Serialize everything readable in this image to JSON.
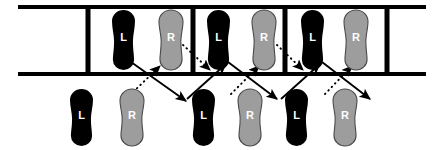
{
  "diagram": {
    "colors": {
      "left_foot": "#000000",
      "right_foot": "#9d9d9d",
      "right_foot_outline": "#4a4a4a",
      "ladder": "#000000",
      "label_text": "#ffffff",
      "background": "#ffffff",
      "arrow_solid": "#000000",
      "arrow_dotted": "#000000"
    },
    "labels": {
      "left": "L",
      "right": "R"
    },
    "ladder": {
      "rail_top_y": 7,
      "rail_bottom_y": 74,
      "rail_x_start": 18,
      "rail_x_end": 426,
      "rail_thickness": 4,
      "rung_thickness": 5,
      "rung_x_positions": [
        88,
        193,
        285,
        387
      ]
    },
    "footprints": [
      {
        "id": "top-l-1",
        "foot": "L",
        "label": "L",
        "row": "top",
        "x": 112,
        "y": 10,
        "w": 23,
        "h": 60
      },
      {
        "id": "top-r-1",
        "foot": "R",
        "label": "R",
        "row": "top",
        "x": 159,
        "y": 10,
        "w": 24,
        "h": 60
      },
      {
        "id": "top-l-2",
        "foot": "L",
        "label": "L",
        "row": "top",
        "x": 207,
        "y": 10,
        "w": 23,
        "h": 60
      },
      {
        "id": "top-r-2",
        "foot": "R",
        "label": "R",
        "row": "top",
        "x": 252,
        "y": 10,
        "w": 24,
        "h": 60
      },
      {
        "id": "top-l-3",
        "foot": "L",
        "label": "L",
        "row": "top",
        "x": 301,
        "y": 10,
        "w": 23,
        "h": 60
      },
      {
        "id": "top-r-3",
        "foot": "R",
        "label": "R",
        "row": "top",
        "x": 344,
        "y": 10,
        "w": 24,
        "h": 60
      },
      {
        "id": "bottom-l-1",
        "foot": "L",
        "label": "L",
        "row": "bottom",
        "x": 70,
        "y": 89,
        "w": 23,
        "h": 57
      },
      {
        "id": "bottom-r-1",
        "foot": "R",
        "label": "R",
        "row": "bottom",
        "x": 120,
        "y": 89,
        "w": 24,
        "h": 57
      },
      {
        "id": "bottom-l-2",
        "foot": "L",
        "label": "L",
        "row": "bottom",
        "x": 192,
        "y": 89,
        "w": 23,
        "h": 57
      },
      {
        "id": "bottom-r-2",
        "foot": "R",
        "label": "R",
        "row": "bottom",
        "x": 238,
        "y": 89,
        "w": 24,
        "h": 57
      },
      {
        "id": "bottom-l-3",
        "foot": "L",
        "label": "L",
        "row": "bottom",
        "x": 285,
        "y": 89,
        "w": 23,
        "h": 57
      },
      {
        "id": "bottom-r-3",
        "foot": "R",
        "label": "R",
        "row": "bottom",
        "x": 333,
        "y": 89,
        "w": 24,
        "h": 57
      }
    ],
    "arrows": [
      {
        "id": "solid-1",
        "style": "solid",
        "x1": 131,
        "y1": 62,
        "x2": 186,
        "y2": 101
      },
      {
        "id": "dotted-1",
        "style": "dotted",
        "x1": 130,
        "y1": 95,
        "x2": 160,
        "y2": 66
      },
      {
        "id": "dotted-2",
        "style": "dotted",
        "x1": 183,
        "y1": 45,
        "x2": 210,
        "y2": 70
      },
      {
        "id": "solid-2",
        "style": "solid",
        "x1": 187,
        "y1": 99,
        "x2": 226,
        "y2": 64
      },
      {
        "id": "solid-3",
        "style": "solid",
        "x1": 228,
        "y1": 62,
        "x2": 277,
        "y2": 99
      },
      {
        "id": "dotted-3",
        "style": "dotted",
        "x1": 231,
        "y1": 94,
        "x2": 259,
        "y2": 66
      },
      {
        "id": "dotted-4",
        "style": "dotted",
        "x1": 277,
        "y1": 45,
        "x2": 303,
        "y2": 70
      },
      {
        "id": "solid-4",
        "style": "solid",
        "x1": 281,
        "y1": 99,
        "x2": 320,
        "y2": 64
      },
      {
        "id": "solid-5",
        "style": "solid",
        "x1": 322,
        "y1": 62,
        "x2": 370,
        "y2": 99
      },
      {
        "id": "dotted-5",
        "style": "dotted",
        "x1": 325,
        "y1": 94,
        "x2": 352,
        "y2": 66
      }
    ]
  }
}
